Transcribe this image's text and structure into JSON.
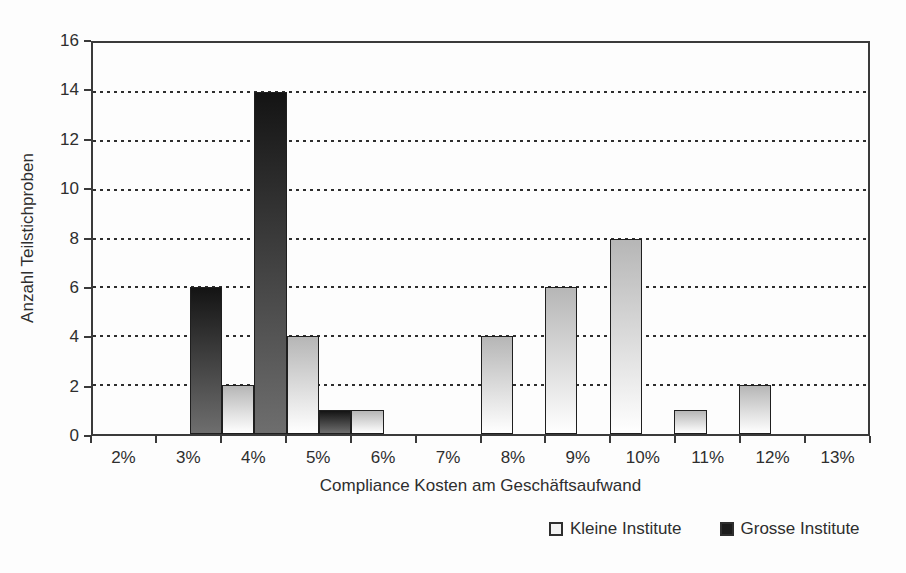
{
  "chart_data": {
    "type": "bar",
    "title": "",
    "categories": [
      "2%",
      "3%",
      "4%",
      "5%",
      "6%",
      "7%",
      "8%",
      "9%",
      "10%",
      "11%",
      "12%",
      "13%"
    ],
    "series": [
      {
        "name": "Kleine Institute",
        "values": [
          0,
          0,
          2,
          4,
          1,
          0,
          4,
          6,
          8,
          1,
          2,
          0
        ],
        "color_top": "#b6b6b6",
        "color_bottom": "#ffffff"
      },
      {
        "name": "Grosse Institute",
        "values": [
          0,
          6,
          14,
          1,
          0,
          0,
          0,
          0,
          0,
          0,
          0,
          0
        ],
        "color_top": "#141414",
        "color_bottom": "#6e6e6e"
      }
    ],
    "xlabel": "Compliance Kosten am Geschäftsaufwand",
    "ylabel": "Anzahl Teilstichproben",
    "ylim": [
      0,
      16
    ],
    "yticks": [
      0,
      2,
      4,
      6,
      8,
      10,
      12,
      14,
      16
    ],
    "grid": "dashed-horizontal",
    "legend_position": "bottom-right",
    "bar_layout": "grouped, two half-width bars per category, no gaps",
    "axis_color": "#3a3a3a",
    "text_color": "#2e2e2e"
  }
}
